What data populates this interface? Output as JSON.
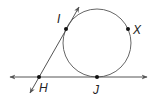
{
  "diagram": {
    "type": "geometry",
    "colors": {
      "line": "#444444",
      "point": "#111111",
      "circle": "#555555"
    },
    "circle": {
      "cx": 97,
      "cy": 43,
      "r": 34
    },
    "lines": [
      {
        "name": "horizontal-tangent",
        "x1": 10,
        "y1": 77,
        "x2": 147,
        "y2": 77,
        "arrows": "both"
      },
      {
        "name": "slanted-tangent",
        "x1": 30,
        "y1": 93,
        "x2": 79,
        "y2": 7,
        "arrows": "both"
      }
    ],
    "points": [
      {
        "label": "I",
        "x": 66,
        "y": 29,
        "lx": 57,
        "ly": 23
      },
      {
        "label": "X",
        "x": 128,
        "y": 29,
        "lx": 133,
        "ly": 34
      },
      {
        "label": "H",
        "x": 39,
        "y": 77,
        "lx": 39,
        "ly": 92
      },
      {
        "label": "J",
        "x": 97,
        "y": 77,
        "lx": 93,
        "ly": 94
      }
    ]
  }
}
